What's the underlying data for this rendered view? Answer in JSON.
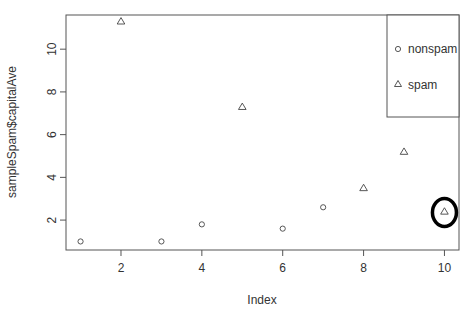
{
  "chart_data": {
    "type": "scatter",
    "title": "",
    "xlabel": "Index",
    "ylabel": "sampleSpam$capitalAve",
    "xlim": [
      0.64,
      10.36
    ],
    "ylim": [
      0.6,
      11.6
    ],
    "x_ticks": [
      2,
      4,
      6,
      8,
      10
    ],
    "y_ticks": [
      2,
      4,
      6,
      8,
      10
    ],
    "grid": false,
    "legend_position": "topright",
    "series": [
      {
        "name": "nonspam",
        "marker": "circle",
        "points": [
          {
            "x": 1,
            "y": 1.0
          },
          {
            "x": 3,
            "y": 1.0
          },
          {
            "x": 4,
            "y": 1.8
          },
          {
            "x": 6,
            "y": 1.6
          },
          {
            "x": 7,
            "y": 2.6
          }
        ]
      },
      {
        "name": "spam",
        "marker": "triangle",
        "points": [
          {
            "x": 2,
            "y": 11.3
          },
          {
            "x": 5,
            "y": 7.3
          },
          {
            "x": 8,
            "y": 3.5
          },
          {
            "x": 9,
            "y": 5.2
          },
          {
            "x": 10,
            "y": 2.4
          }
        ]
      }
    ],
    "annotations": [
      {
        "type": "ellipse-highlight",
        "x": 10,
        "y": 2.4,
        "color": "#000000"
      }
    ]
  },
  "legend": {
    "items": [
      {
        "label": "nonspam",
        "marker": "circle"
      },
      {
        "label": "spam",
        "marker": "triangle"
      }
    ]
  },
  "colors": {
    "axis": "#555555",
    "marker": "#444444",
    "highlight": "#000000"
  }
}
